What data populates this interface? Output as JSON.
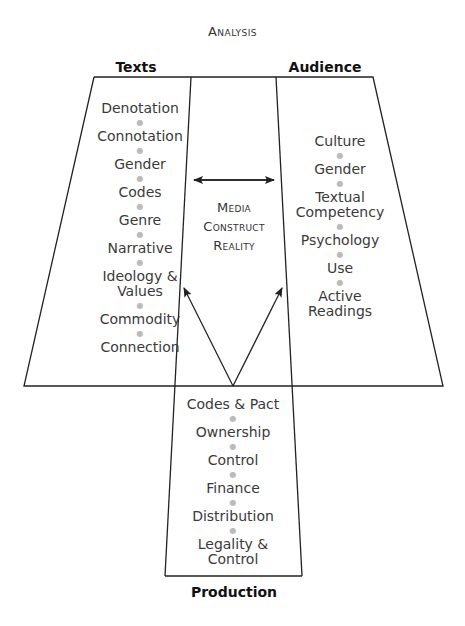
{
  "title": "Analysis",
  "headings": {
    "texts": "Texts",
    "audience": "Audience",
    "production": "Production"
  },
  "center_label": {
    "line1": "Media",
    "line2": "Construct",
    "line3": "Reality"
  },
  "texts_items": [
    "Denotation",
    "Connotation",
    "Gender",
    "Codes",
    "Genre",
    "Narrative",
    "Ideology &",
    "Values",
    "Commodity",
    "Connection"
  ],
  "audience_items": [
    "Culture",
    "Gender",
    "Textual",
    "Competency",
    "Psychology",
    "Use",
    "Active",
    "Readings"
  ],
  "production_items": [
    "Codes & Pact",
    "Ownership",
    "Control",
    "Finance",
    "Distribution",
    "Legality &",
    "Control"
  ],
  "colors": {
    "line": "#222222",
    "text": "#3a3a3a",
    "separator_dot": "#bbbbbb"
  }
}
